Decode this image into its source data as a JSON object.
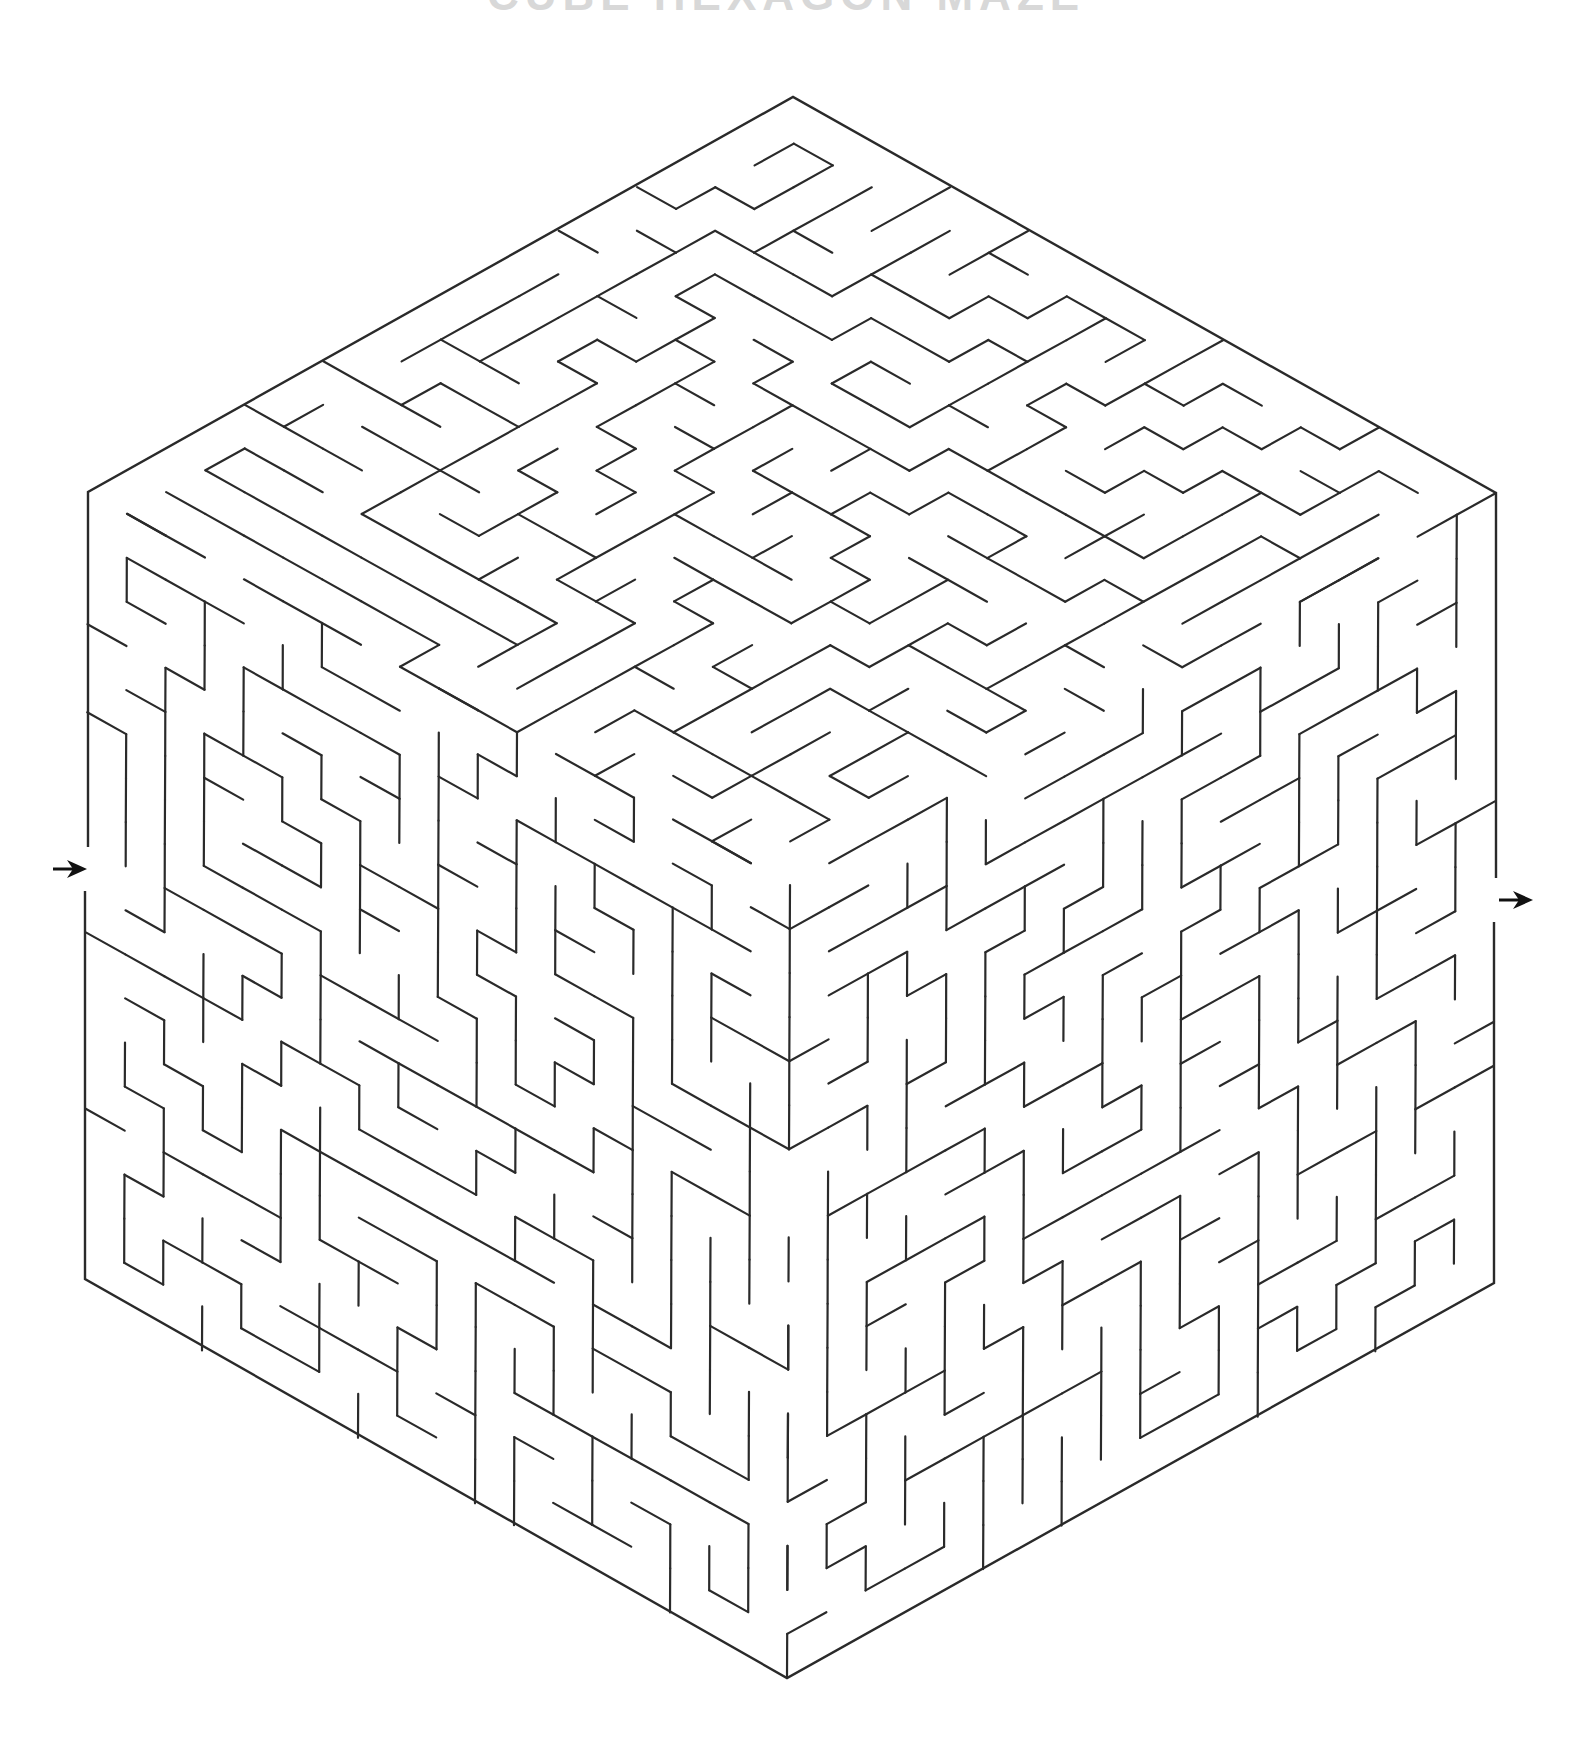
{
  "page": {
    "title": "CUBE HEXAGON MAZE",
    "background": "#ffffff",
    "line_color": "#2a2a2a"
  },
  "maze": {
    "shape": "hexagon (isometric cube)",
    "vertices": {
      "top": [
        793,
        97
      ],
      "top_right": [
        1496,
        493
      ],
      "bottom_right": [
        1494,
        1283
      ],
      "bottom": [
        787,
        1678
      ],
      "bottom_left": [
        85,
        1279
      ],
      "top_left": [
        88,
        492
      ]
    },
    "center": [
      790,
      885
    ],
    "grid_cells_per_face": 18,
    "seed": 20240611,
    "entrance": {
      "label": "start-arrow",
      "side": "left",
      "position": [
        87,
        869
      ],
      "direction": "right"
    },
    "exit": {
      "label": "finish-arrow",
      "side": "right",
      "position": [
        1533,
        900
      ],
      "direction": "right"
    }
  }
}
